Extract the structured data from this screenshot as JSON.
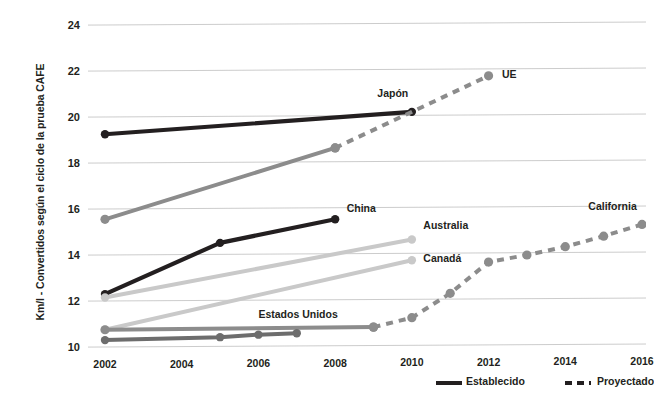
{
  "chart_data": {
    "type": "line",
    "title": "",
    "xlabel": "",
    "ylabel": "Km/l - Convertidos según el ciclo de la prueba CAFE",
    "xlim": [
      2001.3,
      2016.3
    ],
    "ylim": [
      9.3,
      24.6
    ],
    "xticks": [
      2002,
      2004,
      2006,
      2008,
      2010,
      2012,
      2014,
      2016
    ],
    "xticklabels": [
      "2002",
      "2004",
      "2006",
      "2008",
      "2010",
      "2012",
      "2014",
      "2016"
    ],
    "yticks": [
      10,
      12,
      14,
      16,
      18,
      20,
      22,
      24
    ],
    "yticklabels": [
      "10",
      "12",
      "14",
      "16",
      "18",
      "20",
      "22",
      "24"
    ],
    "grid": true,
    "legend_position": "bottom-right",
    "legend": [
      {
        "label": "Establecido",
        "style": "solid"
      },
      {
        "label": "Proyectado",
        "style": "dashed"
      }
    ],
    "series": [
      {
        "name": "Japón",
        "color": "#231f20",
        "label_x": 2009.1,
        "label_y": 20.95,
        "established": {
          "x": [
            2002,
            2010
          ],
          "y": [
            19.25,
            20.15
          ]
        },
        "projected": {
          "x": [],
          "y": []
        }
      },
      {
        "name": "UE",
        "color": "#8c8c8c",
        "label_x": 2012.35,
        "label_y": 21.75,
        "established": {
          "x": [
            2002,
            2008
          ],
          "y": [
            15.55,
            18.6
          ]
        },
        "projected": {
          "x": [
            2008,
            2012
          ],
          "y": [
            18.6,
            21.7
          ]
        }
      },
      {
        "name": "China",
        "color": "#231f20",
        "label_x": 2008.3,
        "label_y": 15.95,
        "established": {
          "x": [
            2002,
            2005,
            2008
          ],
          "y": [
            12.3,
            14.5,
            15.5
          ]
        },
        "projected": {
          "x": [],
          "y": []
        }
      },
      {
        "name": "Australia",
        "color": "#c9c9c9",
        "label_x": 2010.3,
        "label_y": 15.2,
        "established": {
          "x": [
            2002,
            2010
          ],
          "y": [
            12.15,
            14.6
          ]
        },
        "projected": {
          "x": [],
          "y": []
        }
      },
      {
        "name": "Canadá",
        "color": "#c9c9c9",
        "label_x": 2010.3,
        "label_y": 13.75,
        "established": {
          "x": [
            2002,
            2010
          ],
          "y": [
            10.75,
            13.7
          ]
        },
        "projected": {
          "x": [],
          "y": []
        }
      },
      {
        "name": "California",
        "color": "#8c8c8c",
        "label_x": 2014.6,
        "label_y": 15.95,
        "established": {
          "x": [
            2002,
            2009
          ],
          "y": [
            10.75,
            10.8
          ]
        },
        "projected": {
          "x": [
            2009,
            2010,
            2011,
            2012,
            2013,
            2014,
            2015,
            2016
          ],
          "y": [
            10.8,
            11.2,
            12.25,
            13.6,
            13.9,
            14.25,
            14.7,
            15.2
          ]
        }
      },
      {
        "name": "Estados Unidos",
        "color": "#6d6d6d",
        "label_x": 2006.0,
        "label_y": 11.35,
        "established": {
          "x": [
            2002,
            2005,
            2006,
            2007
          ],
          "y": [
            10.3,
            10.4,
            10.5,
            10.55
          ]
        },
        "projected": {
          "x": [],
          "y": []
        }
      }
    ]
  },
  "colors": {
    "text": "#231f20",
    "grid": "#c6c6c6",
    "dark": "#231f20",
    "mid": "#8c8c8c",
    "light": "#c9c9c9",
    "us": "#6d6d6d"
  }
}
